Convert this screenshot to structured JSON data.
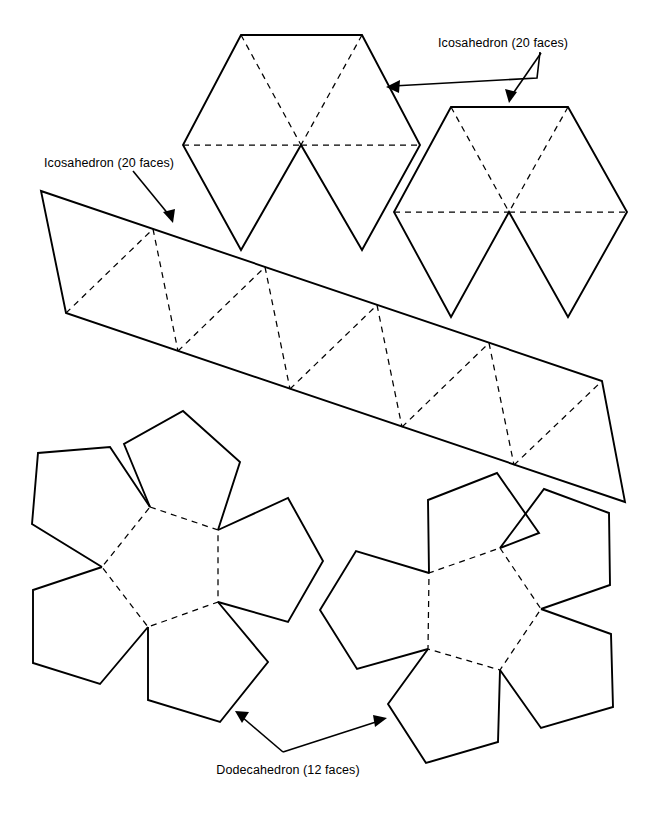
{
  "figure": {
    "background_color": "#ffffff",
    "line_color": "#000000",
    "width": 659,
    "height": 813
  },
  "labels": {
    "icosahedron_top": "Icosahedron (20 faces)",
    "icosahedron_left": "Icosahedron (20 faces)",
    "dodecahedron_bottom": "Dodecahedron (12 faces)"
  },
  "shapes": {
    "icosahedron_cap_left": {
      "name": "icosahedron-cap-left",
      "description": "Six equilateral triangles arranged around a common centre, forming the top cap of an icosahedron",
      "face_count": 6,
      "outline_points": "241,35 362,35 420,145 362,250 301,145 241,250 183,145",
      "fold_lines": [
        "241,35 301,145",
        "362,35 301,145",
        "183,145 301,145",
        "301,145 420,145"
      ]
    },
    "icosahedron_cap_right": {
      "name": "icosahedron-cap-right",
      "description": "Six equilateral triangles arranged around a common centre, forming the bottom cap of an icosahedron",
      "face_count": 6,
      "outline_points": "451,107 568,107 627,212 568,317 509,212 451,317 394,212",
      "fold_lines": [
        "451,107 509,212",
        "568,107 509,212",
        "394,212 509,212",
        "509,212 627,212"
      ]
    },
    "icosahedron_band": {
      "name": "icosahedron-antiprism-band",
      "description": "Slanted strip of ten triangles that forms the middle antiprism band of an icosahedron",
      "face_count": 10,
      "outline_points": "41,191 602,381 625,502 66,313",
      "top_edge_nodes": "41,191 153,229 265,267 377,305 489,343 602,381",
      "bottom_edge_nodes": "66,313 178,351 290,389 402,427 514,465 625,502",
      "fold_lines": [
        "66,313 153,229",
        "153,229 178,351",
        "178,351 265,267",
        "265,267 290,389",
        "290,389 377,305",
        "377,305 402,427",
        "402,427 489,343",
        "489,343 514,465",
        "514,465 602,381"
      ]
    },
    "dodecahedron_half_left": {
      "name": "dodecahedron-half-left",
      "description": "Central pentagon with five pentagons folded around it; one half of a dodecahedron net",
      "face_count": 6,
      "centre_pentagon": "150,507 218,530 218,602 148,627 102,567",
      "outer_pentagons": [
        "150,507 218,530 240,462 183,411 124,444",
        "218,530 218,602 288,622 323,561 288,498",
        "218,602 148,627 148,700 220,722 268,662",
        "148,627 102,567 33,590 33,663 100,684",
        "102,567 150,507 110,447 38,453 32,524"
      ]
    },
    "dodecahedron_half_right": {
      "name": "dodecahedron-half-right",
      "description": "Central pentagon with five pentagons folded around it; the mirrored half of a dodecahedron net",
      "face_count": 6,
      "centre_pentagon": "500,548 541,609 500,670 428,649 429,573",
      "outer_pentagons": [
        "500,548 429,573 428,500 497,473 539,533",
        "429,573 428,649 357,669 320,610 356,551",
        "428,649 500,670 498,742 426,763 388,704",
        "500,670 541,609 611,634 613,707 541,728",
        "541,609 500,548 544,489 609,513 610,585"
      ]
    }
  },
  "leaders": [
    {
      "name": "leader-icosahedron-top-left",
      "path": "540,52 388,88",
      "arrow_at": "388,88",
      "arrow_angle": 167
    },
    {
      "name": "leader-icosahedron-top-right",
      "path": "550,52 513,100",
      "arrow_at": "513,100",
      "arrow_angle": 52
    },
    {
      "name": "leader-icosahedron-left",
      "path": "133,170 170,219",
      "arrow_at": "170,219",
      "arrow_angle": 53
    },
    {
      "name": "leader-dodecahedron-left",
      "path": "283,750 237,713",
      "arrow_at": "237,713",
      "arrow_angle": 219
    },
    {
      "name": "leader-dodecahedron-right",
      "path": "283,750 384,718",
      "arrow_at": "384,718",
      "arrow_angle": 342
    }
  ],
  "caption_positions": {
    "icosahedron_top": {
      "x": 438,
      "y": 47
    },
    "icosahedron_left": {
      "x": 44,
      "y": 167
    },
    "dodecahedron_bottom": {
      "x": 288,
      "y": 774
    }
  }
}
